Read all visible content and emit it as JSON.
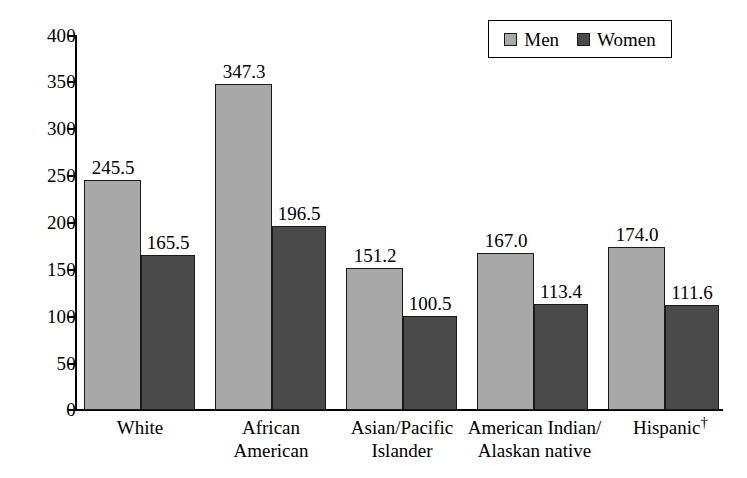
{
  "chart_data": {
    "type": "bar",
    "title": "",
    "subtitle": "",
    "xlabel": "",
    "ylabel": "",
    "ylim": [
      0,
      400
    ],
    "ytick_values": [
      0,
      50,
      100,
      150,
      200,
      250,
      300,
      350,
      400
    ],
    "ytick_labels": [
      "0",
      "50",
      "100",
      "150",
      "200",
      "250",
      "300",
      "350",
      "400"
    ],
    "grid": false,
    "legend_position": "top-right",
    "categories": [
      "White",
      "African American",
      "Asian/Pacific Islander",
      "American Indian/ Alaskan native",
      "Hispanic"
    ],
    "category_lines": [
      [
        "White"
      ],
      [
        "African",
        "American"
      ],
      [
        "Asian/Pacific",
        "Islander"
      ],
      [
        "American Indian/",
        "Alaskan native"
      ],
      [
        "Hispanic"
      ]
    ],
    "category_footnote_marks": [
      "",
      "",
      "",
      "",
      "†"
    ],
    "series": [
      {
        "name": "Men",
        "color": "#a8a8a8",
        "values": [
          245.5,
          347.3,
          151.2,
          167.0,
          174.0
        ],
        "value_labels": [
          "245.5",
          "347.3",
          "151.2",
          "167.0",
          "174.0"
        ]
      },
      {
        "name": "Women",
        "color": "#4a4a4a",
        "values": [
          165.5,
          196.5,
          100.5,
          113.4,
          111.6
        ],
        "value_labels": [
          "165.5",
          "196.5",
          "100.5",
          "113.4",
          "111.6"
        ]
      }
    ]
  },
  "legend": {
    "entries": [
      {
        "label": "Men",
        "color": "#a8a8a8"
      },
      {
        "label": "Women",
        "color": "#4a4a4a"
      }
    ]
  },
  "axis": {
    "y_labels": [
      "400",
      "350",
      "300",
      "250",
      "200",
      "150",
      "100",
      "50",
      "0"
    ]
  },
  "colors": {
    "men": "#a8a8a8",
    "women": "#4a4a4a",
    "axis": "#000000",
    "background": "#ffffff"
  }
}
